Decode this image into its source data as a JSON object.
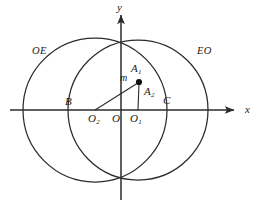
{
  "figure": {
    "background_color": "#ffffff",
    "stroke_color": "#2b2b2b",
    "width": 265,
    "height": 208
  },
  "axes": {
    "x_label": "x",
    "y_label": "y",
    "origin_label": "O",
    "x_axis": {
      "y": 110,
      "x_start": 10,
      "x_end": 237,
      "arrow": "right"
    },
    "y_axis": {
      "x": 121,
      "y_start": 12,
      "y_end": 200,
      "arrow": "up"
    }
  },
  "circles": [
    {
      "id": "circle-left",
      "center_label": "O",
      "center_subscript": "2",
      "center": {
        "x": 95,
        "y": 110
      },
      "radius": 72
    },
    {
      "id": "circle-right",
      "center_label": "O",
      "center_subscript": "1",
      "center": {
        "x": 138,
        "y": 110
      },
      "radius": 70
    }
  ],
  "points": [
    {
      "id": "point-a1",
      "label": "A",
      "subscript": "1",
      "x": 139,
      "y": 82,
      "marker": "filled-dot"
    },
    {
      "id": "point-a2",
      "label": "A",
      "subscript": "2",
      "x": 139,
      "y": 82,
      "marker": "none"
    },
    {
      "id": "point-b",
      "label": "B",
      "x": 68,
      "y": 110,
      "marker": "none"
    },
    {
      "id": "point-c",
      "label": "C",
      "x": 167,
      "y": 110,
      "marker": "none"
    },
    {
      "id": "point-o",
      "label": "O",
      "x": 121,
      "y": 110,
      "marker": "none"
    },
    {
      "id": "point-o1",
      "label": "O",
      "subscript": "1",
      "x": 138,
      "y": 110,
      "marker": "none"
    },
    {
      "id": "point-o2",
      "label": "O",
      "subscript": "2",
      "x": 95,
      "y": 110,
      "marker": "none"
    }
  ],
  "segments": [
    {
      "id": "segment-o2-a1",
      "from": "O2",
      "to": "A1",
      "label": "m"
    },
    {
      "id": "segment-o1-a1",
      "from": "O1",
      "to": "A1",
      "label": ""
    }
  ],
  "labels": {
    "region_left": "OE",
    "region_right": "EO",
    "segment_m": "m",
    "point_a1": "A",
    "point_a1_sub": "1",
    "point_a2": "A",
    "point_a2_sub": "2",
    "point_b": "B",
    "point_c": "C",
    "point_o": "O",
    "point_o1": "O",
    "point_o1_sub": "1",
    "point_o2": "O",
    "point_o2_sub": "2",
    "axis_x": "x",
    "axis_y": "y"
  }
}
